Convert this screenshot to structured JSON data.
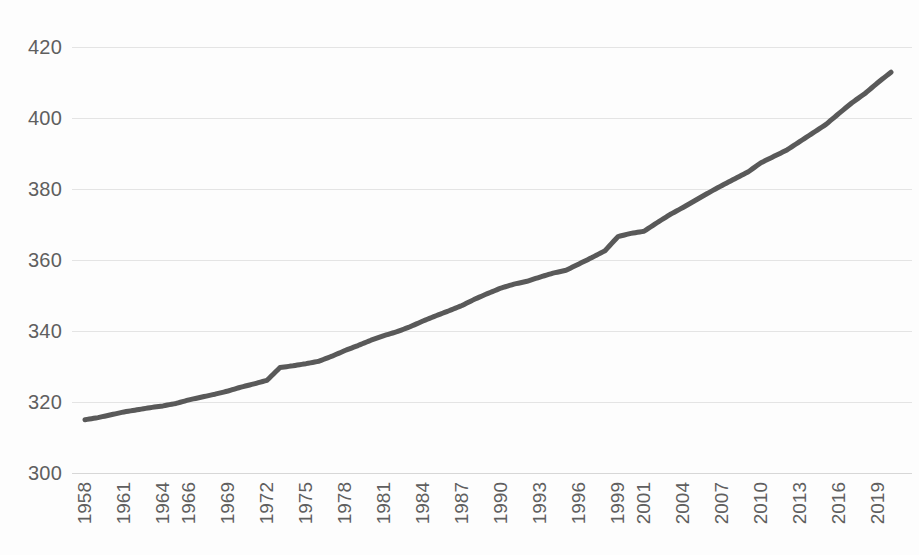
{
  "chart_data": {
    "type": "line",
    "title": "",
    "subtitle": "",
    "xlabel": "",
    "ylabel": "",
    "ylim": [
      300,
      420
    ],
    "xlim": [
      1958,
      2020
    ],
    "grid": true,
    "legend": false,
    "legend_position": "none",
    "series_color": "#595959",
    "gridline_color": "#e4e4e4",
    "tick_label_color": "#5f5f5f",
    "background_color": "#ffffff",
    "y_ticks": [
      300,
      320,
      340,
      360,
      380,
      400,
      420
    ],
    "y_tick_labels": [
      "300",
      "320",
      "340",
      "360",
      "380",
      "400",
      "420"
    ],
    "x_tick_labels": [
      "1958",
      "1961",
      "1964",
      "1966",
      "1969",
      "1972",
      "1975",
      "1978",
      "1981",
      "1984",
      "1987",
      "1990",
      "1993",
      "1996",
      "1999",
      "2001",
      "2004",
      "2007",
      "2010",
      "2013",
      "2016",
      "2019"
    ],
    "x_tick_years": [
      1958,
      1961,
      1964,
      1966,
      1969,
      1972,
      1975,
      1978,
      1981,
      1984,
      1987,
      1990,
      1993,
      1996,
      1999,
      2001,
      2004,
      2007,
      2010,
      2013,
      2016,
      2019
    ],
    "x": [
      1958,
      1959,
      1960,
      1961,
      1962,
      1963,
      1964,
      1965,
      1966,
      1967,
      1968,
      1969,
      1970,
      1971,
      1972,
      1973,
      1974,
      1975,
      1976,
      1977,
      1978,
      1979,
      1980,
      1981,
      1982,
      1983,
      1984,
      1985,
      1986,
      1987,
      1988,
      1989,
      1990,
      1991,
      1992,
      1993,
      1994,
      1995,
      1996,
      1997,
      1998,
      1999,
      2000,
      2001,
      2002,
      2003,
      2004,
      2005,
      2006,
      2007,
      2008,
      2009,
      2010,
      2011,
      2012,
      2013,
      2014,
      2015,
      2016,
      2017,
      2018,
      2019,
      2020
    ],
    "values": [
      315.0,
      315.6,
      316.4,
      317.2,
      317.8,
      318.4,
      318.9,
      319.6,
      320.6,
      321.4,
      322.2,
      323.1,
      324.2,
      325.1,
      326.1,
      329.7,
      330.2,
      330.8,
      331.5,
      332.9,
      334.5,
      335.9,
      337.4,
      338.7,
      339.8,
      341.2,
      342.8,
      344.3,
      345.7,
      347.2,
      349.0,
      350.6,
      352.1,
      353.2,
      354.0,
      355.2,
      356.3,
      357.1,
      358.9,
      360.7,
      362.6,
      366.6,
      367.5,
      368.1,
      370.5,
      372.8,
      374.8,
      376.9,
      379.0,
      381.0,
      382.9,
      384.8,
      387.4,
      389.2,
      391.0,
      393.4,
      395.8,
      398.2,
      401.3,
      404.3,
      406.9,
      410.0,
      412.9
    ]
  },
  "chart": {
    "container_name": "co2-line-chart"
  }
}
